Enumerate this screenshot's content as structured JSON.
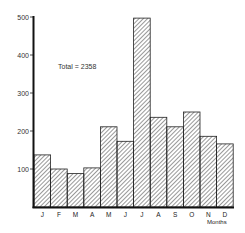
{
  "chart_data": {
    "type": "bar",
    "title": "",
    "xlabel": "Months",
    "ylabel": "",
    "ylim": [
      0,
      500
    ],
    "yticks": [
      100,
      200,
      300,
      400,
      500
    ],
    "grid": false,
    "legend": null,
    "categories": [
      "J",
      "F",
      "M",
      "A",
      "M",
      "J",
      "J",
      "A",
      "S",
      "O",
      "N",
      "D"
    ],
    "values": [
      137,
      100,
      88,
      103,
      211,
      173,
      497,
      236,
      211,
      250,
      186,
      166
    ],
    "annotations": [
      "Total = 2358"
    ],
    "style": {
      "fill": "diagonal-hatch",
      "bar_color": "#222222",
      "background": "#ffffff"
    }
  },
  "labels": {
    "total": "Total = 2358",
    "xaxis": "Months"
  }
}
